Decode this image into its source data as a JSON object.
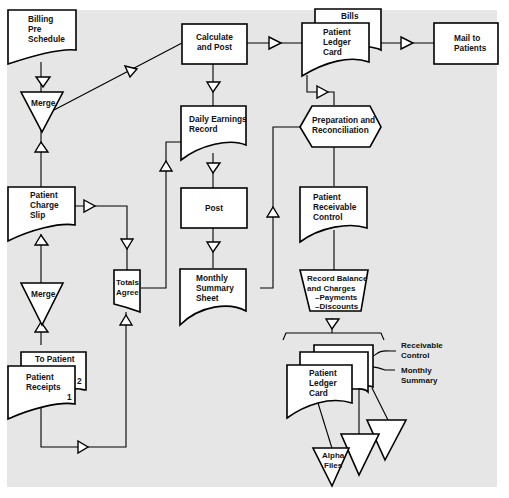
{
  "diagram": {
    "type": "flowchart",
    "nodes": {
      "billing_pre_schedule": {
        "lines": [
          "Billing",
          "Pre",
          "Schedule"
        ],
        "shape": "document"
      },
      "merge_top": {
        "label": "Merge",
        "shape": "merge-triangle"
      },
      "patient_charge_slip": {
        "lines": [
          "Patient",
          "Charge",
          "Slip"
        ],
        "shape": "document"
      },
      "merge_bottom": {
        "label": "Merge",
        "shape": "merge-triangle"
      },
      "to_patient": {
        "label": "To Patient",
        "copy_number": "2",
        "shape": "document-copy"
      },
      "patient_receipts": {
        "lines": [
          "Patient",
          "Receipts"
        ],
        "copy_number": "1",
        "shape": "document"
      },
      "totals_agree": {
        "lines": [
          "Totals",
          "Agree"
        ],
        "shape": "document"
      },
      "calculate_and_post": {
        "lines": [
          "Calculate",
          "and  Post"
        ],
        "shape": "process"
      },
      "daily_earnings_record": {
        "lines": [
          "Daily  Earnings",
          "Record"
        ],
        "shape": "document"
      },
      "post": {
        "label": "Post",
        "shape": "process"
      },
      "monthly_summary_sheet": {
        "lines": [
          "Monthly",
          "Summary",
          "Sheet"
        ],
        "shape": "document"
      },
      "bills": {
        "label": "Bills",
        "shape": "document-copy"
      },
      "patient_ledger_card_top": {
        "lines": [
          "Patient",
          "Ledger",
          "Card"
        ],
        "shape": "document"
      },
      "mail_to_patients": {
        "lines": [
          "Mail  to",
          "Patients"
        ],
        "shape": "process"
      },
      "preparation_and_reconciliation": {
        "lines": [
          "Preparation  and",
          "Reconciliation"
        ],
        "shape": "preparation-hexagon"
      },
      "patient_receivable_control": {
        "lines": [
          "Patient",
          "Receivable",
          "Control"
        ],
        "shape": "document"
      },
      "record_balance_and_charges": {
        "lines": [
          "Record  Balance",
          "and  Charges",
          "–Payments",
          "–Discounts"
        ],
        "shape": "manual-operation"
      },
      "patient_ledger_card_bottom": {
        "lines": [
          "Patient",
          "Ledger",
          "Card"
        ],
        "shape": "document-stack"
      },
      "receivable_control_label": {
        "lines": [
          "Receivable",
          "Control"
        ],
        "shape": "annotation"
      },
      "monthly_summary_label": {
        "lines": [
          "Monthly",
          "Summary"
        ],
        "shape": "annotation"
      },
      "alpha_files": {
        "lines": [
          "Alpha",
          "Files"
        ],
        "shape": "file-triangle"
      }
    },
    "edges": [
      [
        "billing_pre_schedule",
        "merge_top"
      ],
      [
        "patient_charge_slip",
        "merge_top"
      ],
      [
        "merge_top",
        "calculate_and_post"
      ],
      [
        "merge_bottom",
        "patient_charge_slip"
      ],
      [
        "patient_receipts",
        "merge_bottom"
      ],
      [
        "patient_charge_slip",
        "totals_agree"
      ],
      [
        "patient_receipts",
        "totals_agree"
      ],
      [
        "totals_agree",
        "daily_earnings_record"
      ],
      [
        "calculate_and_post",
        "patient_ledger_card_top"
      ],
      [
        "calculate_and_post",
        "daily_earnings_record"
      ],
      [
        "daily_earnings_record",
        "post"
      ],
      [
        "post",
        "monthly_summary_sheet"
      ],
      [
        "monthly_summary_sheet",
        "preparation_and_reconciliation"
      ],
      [
        "patient_ledger_card_top",
        "mail_to_patients"
      ],
      [
        "patient_ledger_card_top",
        "preparation_and_reconciliation"
      ],
      [
        "preparation_and_reconciliation",
        "patient_receivable_control"
      ],
      [
        "patient_receivable_control",
        "record_balance_and_charges"
      ],
      [
        "record_balance_and_charges",
        "patient_ledger_card_bottom"
      ],
      [
        "patient_ledger_card_bottom",
        "alpha_files"
      ]
    ],
    "colors": {
      "background": "#e6e6e6",
      "shape_fill": "#ffffff",
      "stroke": "#000000"
    }
  }
}
